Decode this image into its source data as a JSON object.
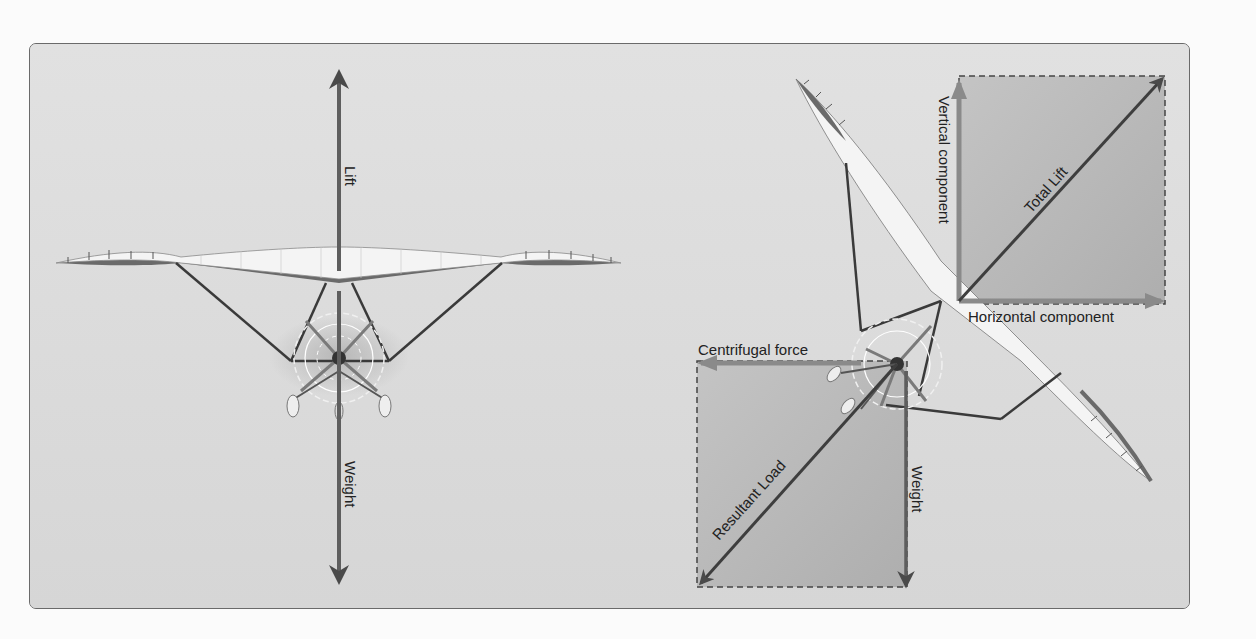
{
  "figure": {
    "left_panel": {
      "title": "Level flight forces",
      "labels": {
        "lift": "Lift",
        "weight": "Weight"
      }
    },
    "right_panel": {
      "title": "Banked turn forces",
      "labels": {
        "vertical_component": "Vertical component",
        "total_lift": "Total Lift",
        "horizontal_component": "Horizontal component",
        "centrifugal_force": "Centrifugal force",
        "resultant_load": "Resultant Load",
        "weight": "Weight"
      }
    }
  },
  "colors": {
    "background": "#dcdcdc",
    "vector_box": "#b9b9b9",
    "arrow": "#5e5e5e",
    "component_arrow": "#8a8a8a",
    "wing_fill": "#f4f4f4",
    "wing_shadow": "#6a6a6a",
    "frame": "#6a6a6a",
    "text": "#222222"
  }
}
